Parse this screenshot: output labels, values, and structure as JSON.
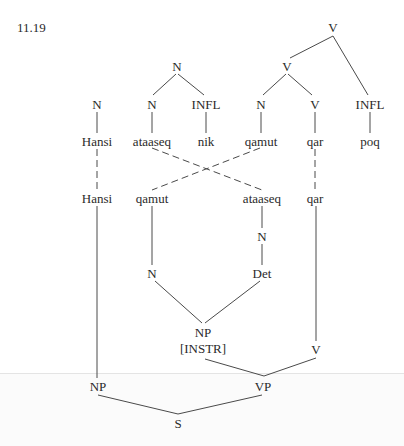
{
  "example_number": "11.19",
  "colors": {
    "ink": "#2a2a2a",
    "line": "#4a4a4a",
    "background": "#ffffff"
  },
  "upper_tree": {
    "root": "V",
    "nodes": {
      "v_top": "V",
      "n_top": "N",
      "v_mid": "V",
      "n_hansi": "N",
      "n_ataaseq": "N",
      "infl_nik": "INFL",
      "n_qamut": "N",
      "v_qar": "V",
      "infl_poq": "INFL"
    },
    "words": [
      "Hansi",
      "ataaseq",
      "nik",
      "qamut",
      "qar",
      "poq"
    ]
  },
  "lower_tree": {
    "words": [
      "Hansi",
      "qamut",
      "ataaseq",
      "qar"
    ],
    "nodes": {
      "n_under_ataaseq": "N",
      "n_left": "N",
      "det": "Det",
      "np_instr": "NP",
      "np_instr_feature": "[INSTR]",
      "v_right": "V",
      "np_subject": "NP",
      "vp": "VP",
      "s": "S"
    }
  }
}
